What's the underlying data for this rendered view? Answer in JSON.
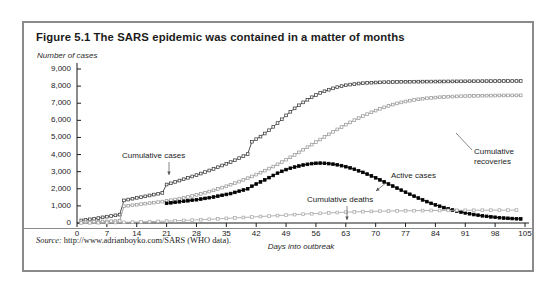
{
  "figure": {
    "title": "Figure 5.1  The SARS epidemic was contained in a matter of months",
    "source_lead": "Source:",
    "source_text": " http://www.adrianboyko.com/SARS (WHO data)."
  },
  "chart_data": {
    "type": "line",
    "title": "Figure 5.1  The SARS epidemic was contained in a matter of months",
    "xlabel": "Days into outbreak",
    "ylabel": "Number of cases",
    "xlim": [
      0,
      105
    ],
    "ylim": [
      0,
      9000
    ],
    "xticks": [
      0,
      7,
      14,
      21,
      28,
      35,
      42,
      49,
      56,
      63,
      70,
      77,
      84,
      91,
      98,
      105
    ],
    "yticks": [
      0,
      1000,
      2000,
      3000,
      4000,
      5000,
      6000,
      7000,
      8000,
      9000
    ],
    "xtick_labels": [
      "0",
      "7",
      "14",
      "21",
      "28",
      "35",
      "42",
      "49",
      "56",
      "63",
      "70",
      "77",
      "84",
      "91",
      "98",
      "105"
    ],
    "ytick_labels": [
      "0",
      "1,000",
      "2,000",
      "3,000",
      "4,000",
      "5,000",
      "6,000",
      "7,000",
      "8,000",
      "9,000"
    ],
    "grid": false,
    "legend": "none",
    "annotations": [
      {
        "text": "Cumulative cases",
        "x": 30,
        "y": 4200,
        "series": "Cumulative cases"
      },
      {
        "text": "Cumulative recoveries",
        "x": 89,
        "y": 5100,
        "series": "Cumulative recoveries"
      },
      {
        "text": "Active cases",
        "x": 76,
        "y": 3450,
        "series": "Active cases"
      },
      {
        "text": "Cumulative deaths",
        "x": 54,
        "y": 1750,
        "series": "Cumulative deaths"
      }
    ],
    "series": [
      {
        "name": "Cumulative cases",
        "color": "#3d3d3d",
        "marker": "square",
        "x": [
          1,
          2,
          3,
          4,
          5,
          6,
          7,
          8,
          9,
          10,
          11,
          12,
          13,
          14,
          15,
          16,
          17,
          18,
          19,
          20,
          21,
          22,
          23,
          24,
          25,
          26,
          27,
          28,
          29,
          30,
          31,
          32,
          33,
          34,
          35,
          36,
          37,
          38,
          39,
          40,
          41,
          42,
          43,
          44,
          45,
          46,
          47,
          48,
          49,
          50,
          51,
          52,
          53,
          54,
          55,
          56,
          57,
          58,
          59,
          60,
          61,
          62,
          63,
          64,
          65,
          66,
          67,
          68,
          69,
          70,
          71,
          72,
          73,
          74,
          75,
          76,
          77,
          78,
          79,
          80,
          81,
          82,
          83,
          84,
          85,
          86,
          87,
          88,
          89,
          90,
          91,
          92,
          93,
          94,
          95,
          96,
          97,
          98,
          99,
          100,
          101,
          102,
          103,
          104
        ],
        "y": [
          150,
          180,
          215,
          250,
          290,
          330,
          370,
          410,
          450,
          490,
          1320,
          1370,
          1420,
          1470,
          1510,
          1560,
          1610,
          1660,
          1710,
          1760,
          2250,
          2320,
          2400,
          2480,
          2560,
          2640,
          2720,
          2800,
          2890,
          2980,
          3070,
          3160,
          3260,
          3360,
          3460,
          3560,
          3670,
          3790,
          3910,
          4030,
          4750,
          4900,
          5050,
          5230,
          5420,
          5620,
          5840,
          6060,
          6290,
          6500,
          6700,
          6880,
          7050,
          7200,
          7350,
          7480,
          7600,
          7700,
          7790,
          7870,
          7940,
          8000,
          8050,
          8090,
          8120,
          8150,
          8170,
          8190,
          8200,
          8210,
          8220,
          8230,
          8235,
          8240,
          8245,
          8250,
          8252,
          8255,
          8258,
          8260,
          8262,
          8264,
          8266,
          8268,
          8270,
          8272,
          8274,
          8276,
          8278,
          8280,
          8282,
          8284,
          8286,
          8288,
          8290,
          8292,
          8294,
          8296,
          8298,
          8300,
          8300,
          8300,
          8300,
          8300
        ]
      },
      {
        "name": "Cumulative recoveries",
        "color": "#9a9a9a",
        "marker": "square",
        "x": [
          1,
          2,
          3,
          4,
          5,
          6,
          7,
          8,
          9,
          10,
          11,
          12,
          13,
          14,
          15,
          16,
          17,
          18,
          19,
          20,
          21,
          22,
          23,
          24,
          25,
          26,
          27,
          28,
          29,
          30,
          31,
          32,
          33,
          34,
          35,
          36,
          37,
          38,
          39,
          40,
          41,
          42,
          43,
          44,
          45,
          46,
          47,
          48,
          49,
          50,
          51,
          52,
          53,
          54,
          55,
          56,
          57,
          58,
          59,
          60,
          61,
          62,
          63,
          64,
          65,
          66,
          67,
          68,
          69,
          70,
          71,
          72,
          73,
          74,
          75,
          76,
          77,
          78,
          79,
          80,
          81,
          82,
          83,
          84,
          85,
          86,
          87,
          88,
          89,
          90,
          91,
          92,
          93,
          94,
          95,
          96,
          97,
          98,
          99,
          100,
          101,
          102,
          103,
          104
        ],
        "y": [
          30,
          40,
          50,
          60,
          70,
          80,
          90,
          100,
          110,
          120,
          980,
          1010,
          1040,
          1070,
          1100,
          1130,
          1160,
          1190,
          1220,
          1250,
          1290,
          1330,
          1370,
          1420,
          1470,
          1520,
          1580,
          1640,
          1700,
          1770,
          1840,
          1910,
          1990,
          2070,
          2150,
          2240,
          2330,
          2420,
          2520,
          2620,
          2720,
          2830,
          2940,
          3060,
          3180,
          3300,
          3430,
          3560,
          3700,
          3840,
          3980,
          4130,
          4280,
          4430,
          4580,
          4730,
          4880,
          5030,
          5180,
          5330,
          5470,
          5610,
          5750,
          5880,
          6010,
          6130,
          6250,
          6360,
          6470,
          6570,
          6670,
          6760,
          6840,
          6920,
          6990,
          7050,
          7100,
          7150,
          7190,
          7230,
          7260,
          7290,
          7310,
          7330,
          7350,
          7365,
          7380,
          7390,
          7400,
          7410,
          7418,
          7425,
          7430,
          7435,
          7440,
          7445,
          7448,
          7450,
          7452,
          7454,
          7456,
          7458,
          7460,
          7460
        ]
      },
      {
        "name": "Active cases",
        "color": "#000000",
        "marker": "square-filled",
        "x": [
          21,
          22,
          23,
          24,
          25,
          26,
          27,
          28,
          29,
          30,
          31,
          32,
          33,
          34,
          35,
          36,
          37,
          38,
          39,
          40,
          41,
          42,
          43,
          44,
          45,
          46,
          47,
          48,
          49,
          50,
          51,
          52,
          53,
          54,
          55,
          56,
          57,
          58,
          59,
          60,
          61,
          62,
          63,
          64,
          65,
          66,
          67,
          68,
          69,
          70,
          71,
          72,
          73,
          74,
          75,
          76,
          77,
          78,
          79,
          80,
          81,
          82,
          83,
          84,
          85,
          86,
          87,
          88,
          89,
          90,
          91,
          92,
          93,
          94,
          95,
          96,
          97,
          98,
          99,
          100,
          101,
          102,
          103,
          104
        ],
        "y": [
          1150,
          1180,
          1210,
          1240,
          1270,
          1300,
          1330,
          1360,
          1400,
          1440,
          1480,
          1520,
          1570,
          1620,
          1670,
          1720,
          1790,
          1860,
          1930,
          2000,
          2150,
          2280,
          2400,
          2520,
          2650,
          2780,
          2910,
          3020,
          3120,
          3200,
          3270,
          3330,
          3390,
          3430,
          3470,
          3490,
          3500,
          3490,
          3470,
          3440,
          3400,
          3350,
          3290,
          3220,
          3140,
          3050,
          2960,
          2860,
          2750,
          2640,
          2520,
          2400,
          2280,
          2160,
          2040,
          1920,
          1800,
          1680,
          1570,
          1460,
          1350,
          1250,
          1150,
          1060,
          980,
          900,
          830,
          760,
          700,
          640,
          590,
          540,
          495,
          455,
          420,
          390,
          360,
          335,
          310,
          290,
          275,
          260,
          248,
          238
        ]
      },
      {
        "name": "Cumulative deaths",
        "color": "#aaaaaa",
        "marker": "square",
        "x": [
          1,
          3,
          5,
          7,
          9,
          11,
          13,
          15,
          17,
          19,
          21,
          23,
          25,
          27,
          29,
          31,
          33,
          35,
          37,
          39,
          41,
          43,
          45,
          47,
          49,
          51,
          53,
          55,
          57,
          59,
          61,
          63,
          65,
          67,
          69,
          71,
          73,
          75,
          77,
          79,
          81,
          83,
          85,
          87,
          89,
          91,
          93,
          95,
          97,
          99,
          101,
          103
        ],
        "y": [
          5,
          10,
          16,
          22,
          30,
          40,
          52,
          65,
          80,
          96,
          112,
          130,
          150,
          172,
          195,
          218,
          243,
          268,
          295,
          322,
          350,
          378,
          406,
          434,
          462,
          490,
          516,
          542,
          566,
          590,
          612,
          632,
          650,
          665,
          678,
          690,
          700,
          708,
          715,
          720,
          725,
          730,
          734,
          738,
          741,
          744,
          746,
          748,
          750,
          752,
          753,
          754
        ]
      }
    ]
  }
}
